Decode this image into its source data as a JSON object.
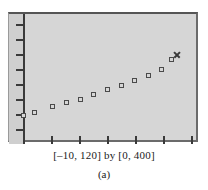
{
  "figure": {
    "caption_range": "[–10, 120] by [0, 400]",
    "caption_label": "(a)",
    "plot_background_color": "#d6d6d6",
    "frame_border_color": "#6b6b6b",
    "axis_color": "#3a3a3a",
    "marker_color": "#4a4a4a"
  },
  "chart_data": {
    "type": "scatter",
    "title": "",
    "subtitle": "",
    "xlabel": "",
    "ylabel": "",
    "xlim": [
      -10,
      120
    ],
    "ylim": [
      0,
      400
    ],
    "grid": false,
    "legend": null,
    "xticks": [
      -10,
      10,
      30,
      50,
      70,
      90,
      110
    ],
    "yticks": [
      0,
      50,
      100,
      150,
      200,
      250,
      300,
      350
    ],
    "series": [
      {
        "name": "data",
        "marker": "open-square",
        "x": [
          0,
          8,
          20,
          30,
          40,
          49,
          59,
          69,
          78,
          88,
          97,
          105
        ],
        "y": [
          45,
          58,
          78,
          94,
          103,
          124,
          144,
          160,
          177,
          196,
          219,
          258
        ]
      },
      {
        "name": "highlighted-point",
        "marker": "x",
        "x": [
          108
        ],
        "y": [
          272
        ]
      }
    ],
    "points_px": [
      {
        "cx": 22,
        "cy": 113
      },
      {
        "cx": 33,
        "cy": 110
      },
      {
        "cx": 51,
        "cy": 104
      },
      {
        "cx": 65,
        "cy": 100
      },
      {
        "cx": 79,
        "cy": 97
      },
      {
        "cx": 92,
        "cy": 92
      },
      {
        "cx": 106,
        "cy": 87
      },
      {
        "cx": 120,
        "cy": 83
      },
      {
        "cx": 133,
        "cy": 78
      },
      {
        "cx": 147,
        "cy": 73
      },
      {
        "cx": 160,
        "cy": 67
      },
      {
        "cx": 170,
        "cy": 57
      }
    ],
    "x_marker_px": {
      "cx": 175,
      "cy": 52
    },
    "y_tick_px": [
      22,
      37,
      52,
      67,
      82,
      97,
      112,
      127
    ],
    "x_tick_px": [
      22,
      50,
      78,
      106,
      134,
      162,
      190
    ]
  }
}
